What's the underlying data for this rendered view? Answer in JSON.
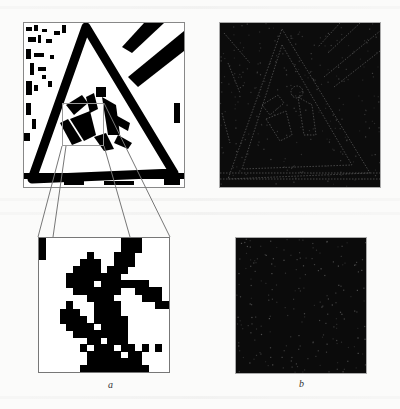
{
  "figure": {
    "panels": [
      {
        "id": "a",
        "label": "a",
        "content": "binarized warning sign image with enlarged inset of selected region"
      },
      {
        "id": "b",
        "label": "b",
        "content": "edge/filter response maps of image and inset"
      }
    ],
    "colors": {
      "page_background": "#fbfbfa",
      "foreground_pixels": "#000000",
      "background_pixels": "#ffffff",
      "response_background": "#0c0c0c",
      "response_edges": "#6a6a6a",
      "frame": "#888888"
    },
    "inset_grid": {
      "cols": 19,
      "rows": 19,
      "cells": [
        "1000000000001110000",
        "1000000000001110000",
        "1000000100011100000",
        "0000001110011100000",
        "0000011110111000000",
        "0000111111110000000",
        "0000111101111111000",
        "0000011111110011110",
        "0000000111100001110",
        "0000100011110000011",
        "0001110011110000000",
        "0001111011111000000",
        "0000111101111000000",
        "0000011111111000000",
        "0000000110111000000",
        "0000001011101101010",
        "0000000111110110000",
        "0000000111111110000",
        "0000001111111111000"
      ]
    }
  }
}
